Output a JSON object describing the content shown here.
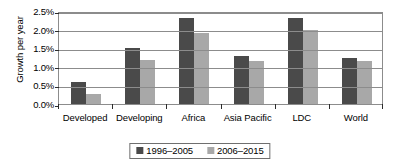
{
  "chart_data": {
    "type": "bar",
    "title": "",
    "xlabel": "",
    "ylabel": "Growth per year",
    "categories": [
      "Developed",
      "Developing",
      "Africa",
      "Asia Pacific",
      "LDC",
      "World"
    ],
    "series": [
      {
        "name": "1996–2005",
        "color": "#4a4a4a",
        "values": [
          0.6,
          1.5,
          2.3,
          1.3,
          2.3,
          1.25
        ]
      },
      {
        "name": "2006–2015",
        "color": "#a8a8a8",
        "values": [
          0.28,
          1.18,
          1.9,
          1.15,
          2.0,
          1.15
        ]
      }
    ],
    "ylim": [
      0.0,
      2.5
    ],
    "ytick_values": [
      0.0,
      0.5,
      1.0,
      1.5,
      2.0,
      2.5
    ],
    "ytick_labels": [
      "0.0%",
      "0.5%",
      "1.0%",
      "1.5%",
      "2.0%",
      "2.5%"
    ],
    "grid": true,
    "grid_axis": "y",
    "legend_position": "bottom-center",
    "axis_color": "#8c8c8c",
    "background": "#ffffff"
  }
}
